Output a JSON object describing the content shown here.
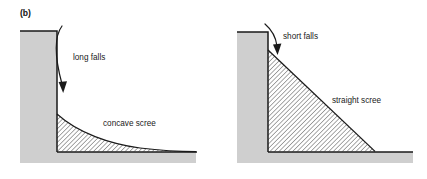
{
  "figure": {
    "tag": "(b)",
    "background_color": "#ffffff"
  },
  "style": {
    "rock_fill": "#cfcfcf",
    "rock_stroke": "#1a1a1a",
    "scree_fill": "#ffffff",
    "scree_hatch_color": "#1a1a1a",
    "line_color": "#1a1a1a",
    "text_color": "#1a1a1a"
  },
  "panels": [
    {
      "id": "left-panel",
      "name": "concave-scree-panel",
      "cliff": {
        "name": "tall-cliff",
        "description": "tall vertical rock face with thick ground mass",
        "top_y": 31,
        "face_x": 57,
        "left_x": 20,
        "ground_y": 152,
        "base_y": 163,
        "right_x": 196
      },
      "scree": {
        "name": "concave-scree-deposit",
        "profile": "concave",
        "apex_x": 57,
        "apex_y": 114,
        "toe_x": 196,
        "toe_y": 151
      },
      "arrow": {
        "name": "long-fall-arrow",
        "start_x": 62,
        "start_y": 26,
        "end_x": 63,
        "end_y": 92,
        "curved": true,
        "direction": "down"
      },
      "labels": [
        {
          "name": "long-falls-label",
          "text": "long falls",
          "x": 73,
          "y": 60,
          "anchor": "start"
        },
        {
          "name": "concave-scree-label",
          "text": "concave scree",
          "x": 103,
          "y": 126,
          "anchor": "start"
        }
      ]
    },
    {
      "id": "right-panel",
      "name": "straight-scree-panel",
      "cliff": {
        "name": "short-cliff",
        "description": "short vertical rock face with thick ground mass",
        "top_y": 32,
        "face_x": 268,
        "left_x": 237,
        "ground_y": 152,
        "base_y": 163,
        "right_x": 413
      },
      "scree": {
        "name": "straight-scree-deposit",
        "profile": "straight",
        "apex_x": 268,
        "apex_y": 50,
        "toe_x": 375,
        "toe_y": 151
      },
      "arrow": {
        "name": "short-fall-arrow",
        "start_x": 265,
        "start_y": 24,
        "end_x": 277,
        "end_y": 54,
        "curved": true,
        "direction": "down"
      },
      "labels": [
        {
          "name": "short-falls-label",
          "text": "short falls",
          "x": 283,
          "y": 39,
          "anchor": "start"
        },
        {
          "name": "straight-scree-label",
          "text": "straight scree",
          "x": 332,
          "y": 103,
          "anchor": "start"
        }
      ]
    }
  ]
}
